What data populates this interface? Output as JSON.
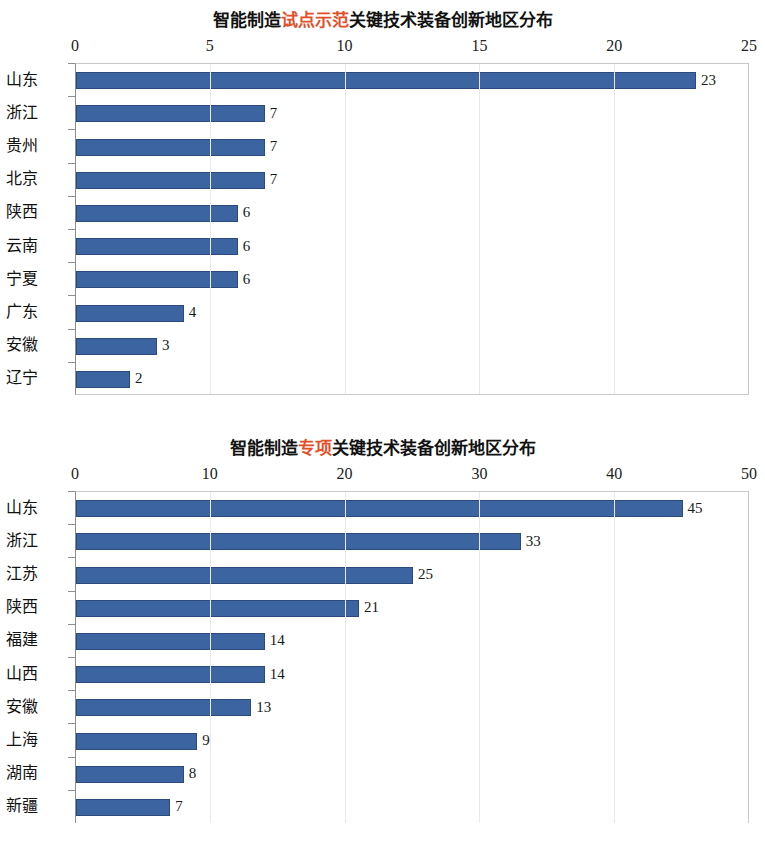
{
  "page": {
    "background_color": "#ffffff",
    "bar_color": "#3c64a0",
    "accent_color": "#e2502a"
  },
  "charts": [
    {
      "id": "chart-1",
      "title_prefix": "智能制造",
      "title_accent": "试点示范",
      "title_suffix": "关键技术装备创新地区分布",
      "title_full": "智能制造试点示范关键技术装备创新地区分布",
      "axis_ticks": [
        "0",
        "5",
        "10",
        "15",
        "20",
        "25"
      ],
      "categories": [
        "山东",
        "浙江",
        "贵州",
        "北京",
        "陕西",
        "云南",
        "宁夏",
        "广东",
        "安徽",
        "辽宁"
      ],
      "values": [
        23,
        7,
        7,
        7,
        6,
        6,
        6,
        4,
        3,
        2
      ],
      "value_labels": [
        "23",
        "7",
        "7",
        "7",
        "6",
        "6",
        "6",
        "4",
        "3",
        "2"
      ]
    },
    {
      "id": "chart-2",
      "title_prefix": "智能制造",
      "title_accent": "专项",
      "title_suffix": "关键技术装备创新地区分布",
      "title_full": "智能制造专项关键技术装备创新地区分布",
      "axis_ticks": [
        "0",
        "10",
        "20",
        "30",
        "40",
        "50"
      ],
      "categories": [
        "山东",
        "浙江",
        "江苏",
        "陕西",
        "福建",
        "山西",
        "安徽",
        "上海",
        "湖南",
        "新疆"
      ],
      "values": [
        45,
        33,
        25,
        21,
        14,
        14,
        13,
        9,
        8,
        7
      ],
      "value_labels": [
        "45",
        "33",
        "25",
        "21",
        "14",
        "14",
        "13",
        "9",
        "8",
        "7"
      ]
    }
  ],
  "chart_data": [
    {
      "type": "bar",
      "orientation": "horizontal",
      "title": "智能制造试点示范关键技术装备创新地区分布",
      "categories": [
        "山东",
        "浙江",
        "贵州",
        "北京",
        "陕西",
        "云南",
        "宁夏",
        "广东",
        "安徽",
        "辽宁"
      ],
      "values": [
        23,
        7,
        7,
        7,
        6,
        6,
        6,
        4,
        3,
        2
      ],
      "xlabel": "",
      "ylabel": "",
      "xlim": [
        0,
        25
      ],
      "xticks": [
        0,
        5,
        10,
        15,
        20,
        25
      ],
      "grid": false,
      "legend": false,
      "data_labels": true,
      "series_color": "#3c64a0"
    },
    {
      "type": "bar",
      "orientation": "horizontal",
      "title": "智能制造专项关键技术装备创新地区分布",
      "categories": [
        "山东",
        "浙江",
        "江苏",
        "陕西",
        "福建",
        "山西",
        "安徽",
        "上海",
        "湖南",
        "新疆"
      ],
      "values": [
        45,
        33,
        25,
        21,
        14,
        14,
        13,
        9,
        8,
        7
      ],
      "xlabel": "",
      "ylabel": "",
      "xlim": [
        0,
        50
      ],
      "xticks": [
        0,
        10,
        20,
        30,
        40,
        50
      ],
      "grid": false,
      "legend": false,
      "data_labels": true,
      "series_color": "#3c64a0"
    }
  ]
}
